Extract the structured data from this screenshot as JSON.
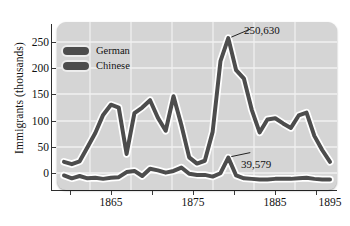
{
  "axes": {
    "ylabel": "Immigrants (thousands)",
    "yticks": [
      "250",
      "200",
      "150",
      "100",
      "50",
      "0"
    ],
    "xticks": [
      "1865",
      "1875",
      "1885",
      "1895"
    ]
  },
  "legend": {
    "items": [
      {
        "label": "German",
        "color": "#4d4d4d"
      },
      {
        "label": "Chinese",
        "color": "#4d4d4d"
      }
    ]
  },
  "annotations": {
    "german_peak": "250,630",
    "chinese_peak": "39,579"
  },
  "chart_data": {
    "type": "line",
    "title": "",
    "xlabel": "",
    "ylabel": "Immigrants (thousands)",
    "xlim": [
      1861,
      1895
    ],
    "ylim": [
      0,
      265
    ],
    "grid": true,
    "legend_position": "upper-left",
    "x": [
      1861,
      1862,
      1863,
      1864,
      1865,
      1866,
      1867,
      1868,
      1869,
      1870,
      1871,
      1872,
      1873,
      1874,
      1875,
      1876,
      1877,
      1878,
      1879,
      1880,
      1881,
      1882,
      1883,
      1884,
      1885,
      1886,
      1887,
      1888,
      1889,
      1890,
      1891,
      1892,
      1893,
      1894,
      1895
    ],
    "series": [
      {
        "name": "German",
        "color": "#4d4d4d",
        "values": [
          32,
          28,
          33,
          58,
          83,
          115,
          133,
          128,
          46,
          118,
          128,
          141,
          110,
          87,
          148,
          97,
          40,
          29,
          34,
          85,
          210,
          250.63,
          194,
          179,
          124,
          84,
          107,
          109,
          100,
          92,
          114,
          119,
          78,
          53,
          32
        ],
        "peak": {
          "x": 1882,
          "y": 250.63,
          "label": "250,630"
        }
      },
      {
        "name": "Chinese",
        "color": "#4d4d4d",
        "values": [
          8,
          3,
          7,
          3,
          4,
          2,
          4,
          5,
          14,
          16,
          7,
          20,
          17,
          13,
          16,
          22,
          11,
          9,
          9,
          6,
          12,
          39.579,
          8,
          3,
          2,
          1,
          1,
          2,
          2,
          2,
          3,
          4,
          2,
          1,
          1
        ],
        "peak": {
          "x": 1882,
          "y": 39.579,
          "label": "39,579"
        }
      }
    ]
  }
}
